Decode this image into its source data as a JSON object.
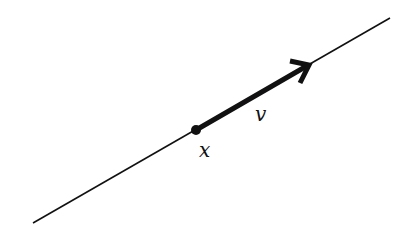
{
  "diagram": {
    "type": "line-with-vector",
    "colors": {
      "stroke": "#111111",
      "background": "#ffffff"
    },
    "line": {
      "from": [
        33,
        223
      ],
      "to": [
        390,
        18
      ]
    },
    "point": {
      "label": "x",
      "position": [
        196,
        130
      ]
    },
    "vector": {
      "label": "v",
      "from": [
        196,
        130
      ],
      "to": [
        309,
        65
      ]
    }
  }
}
